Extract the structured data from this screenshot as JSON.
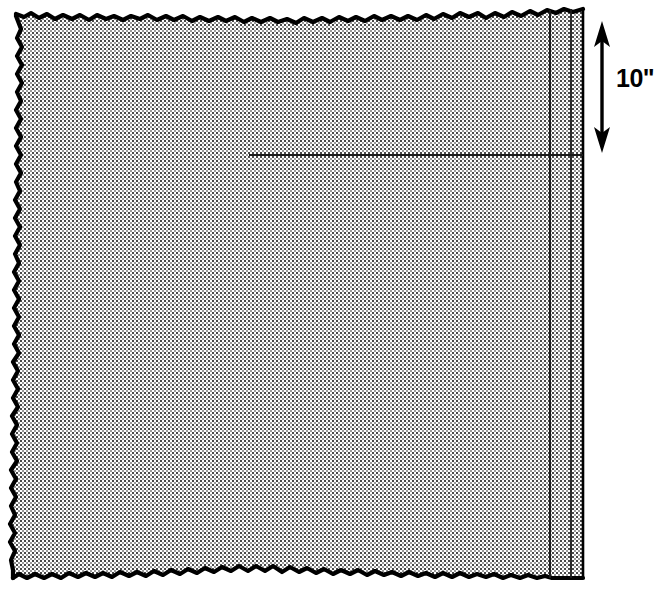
{
  "figure": {
    "kind": "technical-illustration",
    "background_color": "#ffffff",
    "ink_color": "#000000",
    "fabric_fill_color": "#c8c8c8",
    "fabric_texture": "halftone-checkerboard-dots"
  },
  "fabric": {
    "name": "fabric-square",
    "description": "Square of fabric with three torn raw edges and one straight cut edge on the right",
    "left": 12,
    "top": 12,
    "right": 583,
    "bottom": 578,
    "edges": {
      "top": "torn",
      "left": "torn",
      "bottom": "torn",
      "right": "straight-cut"
    }
  },
  "guide_lines": [
    {
      "name": "hem-fold-line-outer",
      "orientation": "vertical",
      "x": 550,
      "y1": 10,
      "y2": 578
    },
    {
      "name": "hem-fold-line-inner",
      "orientation": "vertical",
      "x": 571,
      "y1": 9,
      "y2": 578
    },
    {
      "name": "horizontal-marking-line",
      "orientation": "horizontal",
      "y": 155,
      "x1": 249,
      "x2": 583
    }
  ],
  "dimension": {
    "name": "height-dimension",
    "label": "10\"",
    "value": 10,
    "unit": "inch",
    "arrow": {
      "name": "double-headed-arrow",
      "x": 602,
      "y_top": 22,
      "y_bottom": 152,
      "heads": "both"
    },
    "label_position": {
      "x": 616,
      "y": 67
    }
  }
}
